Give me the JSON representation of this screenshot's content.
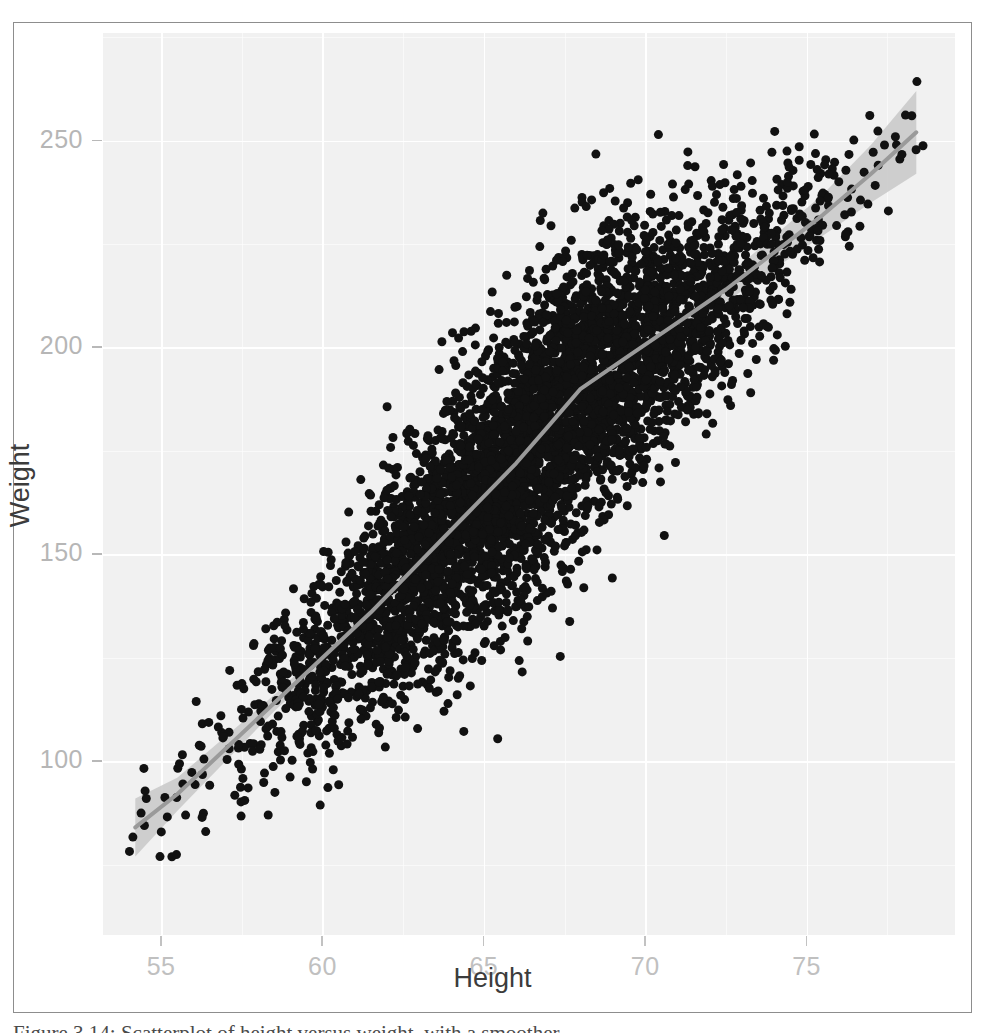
{
  "figure": {
    "axis_title_x": "Height",
    "axis_title_y": "Weight",
    "caption": "Figure 3.14: Scatterplot of height versus weight, with a smoother"
  },
  "chart_data": {
    "type": "scatter",
    "title": "",
    "xlabel": "Height",
    "ylabel": "Weight",
    "xlim": [
      53.2,
      79.6
    ],
    "ylim": [
      58,
      276
    ],
    "xticks": [
      55,
      60,
      65,
      70,
      75
    ],
    "yticks": [
      100,
      150,
      200,
      250
    ],
    "xticks_minor": [
      57.5,
      62.5,
      67.5,
      72.5,
      77.5
    ],
    "yticks_minor": [
      75,
      125,
      175,
      225,
      275
    ],
    "grid": true,
    "legend": "none",
    "n_points": 5000,
    "point_color": "#111111",
    "point_size": 9,
    "panel_background": "#f3f3f3",
    "gridline_color": "#ffffff",
    "smoother": {
      "method": "loess",
      "line_color": "#9a9a9a",
      "ribbon_color": "#c8c8c8",
      "x": [
        54.2,
        55.5,
        57.0,
        58.5,
        60.0,
        61.5,
        63.0,
        64.5,
        66.0,
        67.0,
        68.0,
        69.5,
        71.0,
        72.5,
        74.0,
        75.5,
        77.0,
        78.4
      ],
      "y": [
        84,
        92,
        103,
        114,
        125,
        136,
        148,
        160,
        172,
        181,
        190,
        198,
        206,
        214,
        223,
        232,
        242,
        252
      ],
      "ymin": [
        77,
        88,
        100,
        112,
        123,
        134,
        146,
        158,
        170,
        179,
        188,
        196,
        204,
        211,
        219,
        227,
        235,
        242
      ],
      "ymax": [
        91,
        96,
        106,
        116,
        127,
        138,
        150,
        162,
        174,
        183,
        192,
        200,
        208,
        217,
        227,
        237,
        249,
        262
      ]
    },
    "population_model": {
      "description": "Simulated bivariate population: Weight increases with Height with an S-shaped loess trend and increasing spread in the middle of the Height range.",
      "seed": 20240315,
      "x_mean": 66.4,
      "x_sd": 3.9,
      "residual_sd_base": 13.5
    }
  }
}
